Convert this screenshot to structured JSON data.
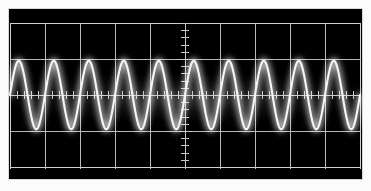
{
  "instrument": {
    "type": "oscilloscope",
    "display_name": "Oscilloscope CRT display",
    "screen_background_color": "#000000",
    "graticule_color": "#b9b9b9",
    "trace_color": "#f5f5f5",
    "bezel_color": "#050505",
    "photo_border_color": "#fbfbfb"
  },
  "graticule": {
    "horizontal_divisions": 10,
    "vertical_divisions": 4,
    "subdivisions_per_division": 5,
    "center_axis_ticks": true,
    "grid_visible": true,
    "vertical_division_x": [
      0,
      35,
      70,
      105,
      140,
      175,
      210,
      245,
      280,
      315,
      350
    ],
    "horizontal_division_y": [
      0,
      36,
      72,
      108,
      144
    ],
    "center_x": 175,
    "center_y": 72
  },
  "chart_data": {
    "type": "line",
    "subtitle": "",
    "xlabel": "Time (divisions)",
    "ylabel": "Amplitude (divisions)",
    "xlim": [
      0,
      10
    ],
    "ylim": [
      -2,
      2
    ],
    "grid": true,
    "legend_position": "none",
    "waveform": "sine",
    "cycles_on_screen": 10,
    "period_divisions": 1.0,
    "amplitude_divisions": 0.95,
    "peak_to_peak_divisions": 1.9,
    "dc_offset_divisions": 0.0,
    "phase_degrees": 0,
    "series": [
      {
        "name": "CH1",
        "color": "#f5f5f5",
        "x": [
          0.0,
          0.05,
          0.1,
          0.15,
          0.2,
          0.25,
          0.3,
          0.35,
          0.4,
          0.45,
          0.5,
          0.55,
          0.6,
          0.65,
          0.7,
          0.75,
          0.8,
          0.85,
          0.9,
          0.95,
          1.0,
          1.05,
          1.1,
          1.15,
          1.2,
          1.25,
          1.3,
          1.35,
          1.4,
          1.45,
          1.5,
          1.55,
          1.6,
          1.65,
          1.7,
          1.75,
          1.8,
          1.85,
          1.9,
          1.95,
          2.0,
          2.05,
          2.1,
          2.15,
          2.2,
          2.25,
          2.3,
          2.35,
          2.4,
          2.45,
          2.5,
          2.55,
          2.6,
          2.65,
          2.7,
          2.75,
          2.8,
          2.85,
          2.9,
          2.95,
          3.0,
          3.05,
          3.1,
          3.15,
          3.2,
          3.25,
          3.3,
          3.35,
          3.4,
          3.45,
          3.5,
          3.55,
          3.6,
          3.65,
          3.7,
          3.75,
          3.8,
          3.85,
          3.9,
          3.95,
          4.0,
          4.05,
          4.1,
          4.15,
          4.2,
          4.25,
          4.3,
          4.35,
          4.4,
          4.45,
          4.5,
          4.55,
          4.6,
          4.65,
          4.7,
          4.75,
          4.8,
          4.85,
          4.9,
          4.95,
          5.0,
          5.05,
          5.1,
          5.15,
          5.2,
          5.25,
          5.3,
          5.35,
          5.4,
          5.45,
          5.5,
          5.55,
          5.6,
          5.65,
          5.7,
          5.75,
          5.8,
          5.85,
          5.9,
          5.95,
          6.0,
          6.05,
          6.1,
          6.15,
          6.2,
          6.25,
          6.3,
          6.35,
          6.4,
          6.45,
          6.5,
          6.55,
          6.6,
          6.65,
          6.7,
          6.75,
          6.8,
          6.85,
          6.9,
          6.95,
          7.0,
          7.05,
          7.1,
          7.15,
          7.2,
          7.25,
          7.3,
          7.35,
          7.4,
          7.45,
          7.5,
          7.55,
          7.6,
          7.65,
          7.7,
          7.75,
          7.8,
          7.85,
          7.9,
          7.95,
          8.0,
          8.05,
          8.1,
          8.15,
          8.2,
          8.25,
          8.3,
          8.35,
          8.4,
          8.45,
          8.5,
          8.55,
          8.6,
          8.65,
          8.7,
          8.75,
          8.8,
          8.85,
          8.9,
          8.95,
          9.0,
          9.05,
          9.1,
          9.15,
          9.2,
          9.25,
          9.3,
          9.35,
          9.4,
          9.45,
          9.5,
          9.55,
          9.6,
          9.65,
          9.7,
          9.75,
          9.8,
          9.85,
          9.9,
          9.95,
          10.0
        ],
        "y_formula": "0.95 * sin(2*pi*x)"
      }
    ]
  },
  "annotations": {
    "visible_text": [],
    "labels": []
  }
}
